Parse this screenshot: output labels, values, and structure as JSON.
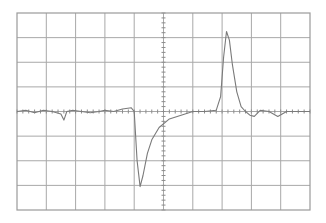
{
  "chart_data": {
    "type": "line",
    "title": "",
    "xlabel": "",
    "ylabel": "",
    "grid": true,
    "divisions": {
      "horizontal": 10,
      "vertical": 8
    },
    "xlim": [
      0,
      10
    ],
    "ylim": [
      -4,
      4
    ],
    "center_axes_minor_ticks_per_division": 5,
    "colors": {
      "background": "#ffffff",
      "grid": "#a8a8a8",
      "border": "#9a9a9a",
      "trace": "#7a7a7a"
    },
    "series": [
      {
        "name": "trace",
        "x": [
          0.0,
          0.3,
          0.6,
          0.9,
          1.2,
          1.5,
          1.6,
          1.7,
          1.9,
          2.2,
          2.5,
          2.8,
          3.0,
          3.3,
          3.6,
          3.9,
          4.0,
          4.1,
          4.2,
          4.3,
          4.45,
          4.6,
          4.85,
          5.2,
          5.6,
          6.0,
          6.4,
          6.8,
          6.95,
          7.05,
          7.15,
          7.25,
          7.35,
          7.5,
          7.65,
          7.8,
          7.95,
          8.1,
          8.3,
          8.6,
          8.9,
          9.2,
          9.5,
          10.0
        ],
        "values": [
          0.0,
          0.05,
          -0.05,
          0.05,
          0.0,
          -0.1,
          -0.35,
          0.0,
          0.05,
          0.0,
          -0.05,
          0.0,
          0.05,
          0.0,
          0.1,
          0.15,
          0.0,
          -2.0,
          -3.05,
          -2.6,
          -1.7,
          -1.15,
          -0.65,
          -0.3,
          -0.15,
          0.0,
          0.0,
          0.05,
          0.6,
          2.2,
          3.25,
          2.9,
          1.9,
          0.8,
          0.2,
          0.0,
          -0.15,
          -0.2,
          0.05,
          0.0,
          -0.2,
          0.0,
          0.0,
          0.0
        ]
      }
    ]
  }
}
